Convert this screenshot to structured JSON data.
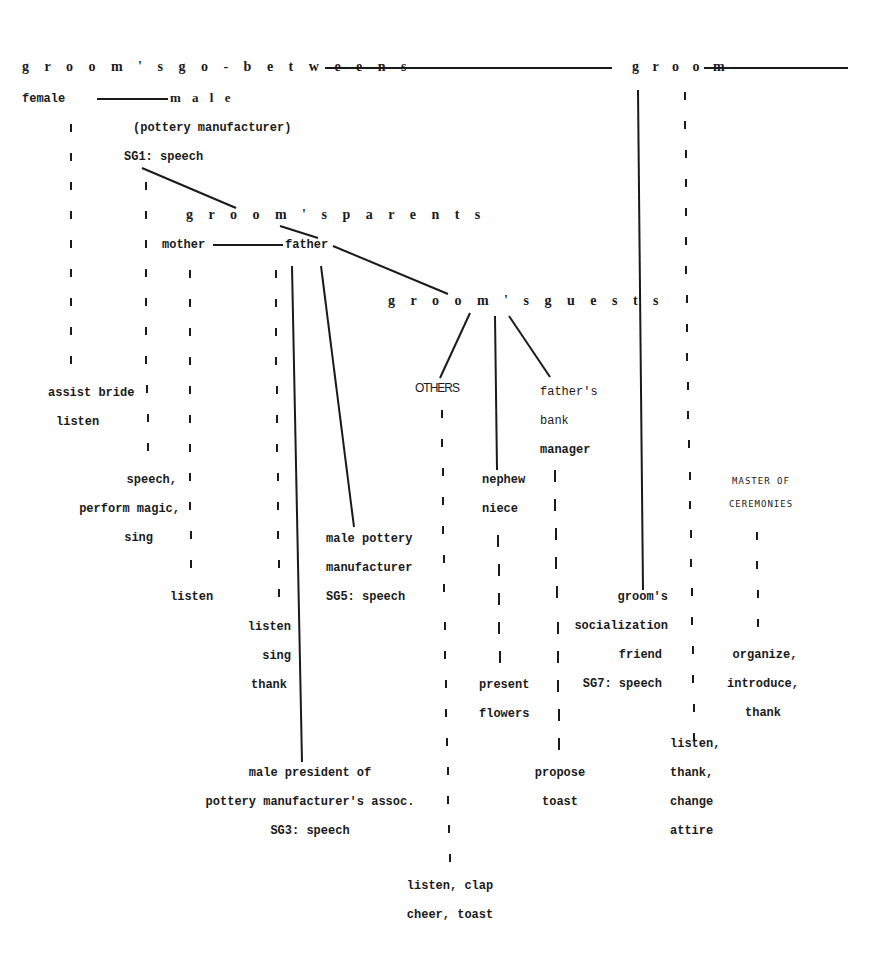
{
  "diagram": {
    "header_groups": {
      "go_betweens": "g r o o m ' s   g o - b e t w e e n s",
      "groom": "g r o o m",
      "parents": "g r o o m ' s   p a r e n t s",
      "guests": "g r o o m ' s   g u e s t s"
    },
    "go_betweens": {
      "female": "female",
      "male": "m a l e",
      "male_role": "(pottery manufacturer)",
      "male_code": "SG1: speech",
      "female_actions": [
        "assist bride",
        "listen"
      ],
      "male_actions": [
        "speech,",
        "perform magic,",
        "sing"
      ]
    },
    "parents": {
      "mother": "mother",
      "father": "father",
      "mother_actions": [
        "listen"
      ],
      "father_actions": [
        "listen",
        "sing",
        "thank"
      ],
      "pottery_manufacturer": [
        "male pottery",
        "manufacturer",
        "SG5: speech"
      ],
      "president": [
        "male president of",
        "pottery manufacturer's assoc.",
        "SG3: speech"
      ]
    },
    "guests": {
      "others": "OTHERS",
      "others_actions": [
        "listen, clap",
        "cheer, toast"
      ],
      "nephew_niece": [
        "nephew",
        "niece"
      ],
      "nephew_niece_actions": [
        "present",
        "flowers"
      ],
      "bank_manager": [
        "father's",
        "bank",
        "manager"
      ],
      "bank_manager_actions": [
        "propose",
        "toast"
      ]
    },
    "groom": {
      "friend": [
        "groom's",
        "socialization",
        "friend",
        "SG7: speech"
      ],
      "groom_actions": [
        "listen,",
        "thank,",
        "change",
        "attire"
      ],
      "mc": [
        "MASTER OF",
        "CEREMONIES"
      ],
      "mc_actions": [
        "organize,",
        "introduce,",
        "thank"
      ]
    }
  }
}
